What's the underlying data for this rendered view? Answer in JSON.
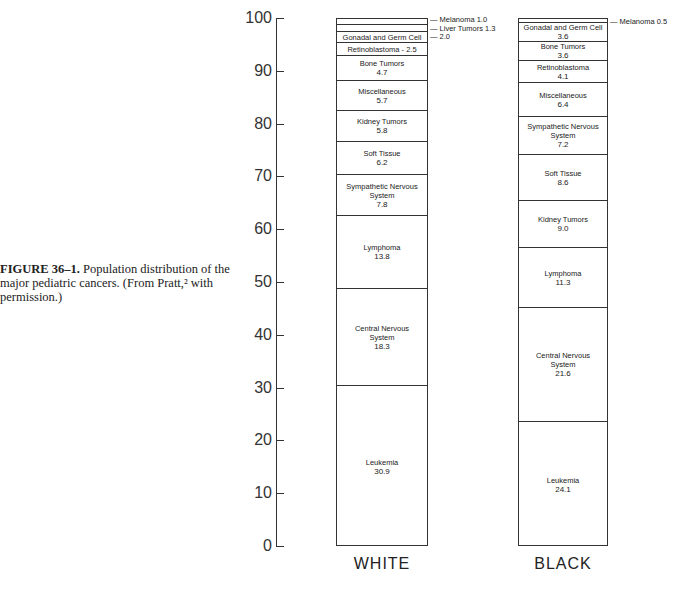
{
  "caption": {
    "label": "FIGURE 36–1.",
    "text": "Population distribution of the major pediatric cancers. (From Pratt,² with permission.)"
  },
  "chart_data": {
    "type": "bar",
    "subtype": "stacked-100-percent",
    "title": "Population distribution of the major pediatric cancers",
    "xlabel": "",
    "ylabel": "",
    "ylim": [
      0,
      100
    ],
    "yticks": [
      "0",
      "10",
      "20",
      "30",
      "40",
      "50",
      "60",
      "70",
      "80",
      "90",
      "100"
    ],
    "categories": [
      "WHITE",
      "BLACK"
    ],
    "grid": false,
    "legend": "none (labels inside segments / callouts)",
    "series": [
      {
        "name": "WHITE",
        "segments_bottom_to_top": [
          {
            "label": "Leukemia",
            "value": 30.9
          },
          {
            "label": "Central Nervous System",
            "value": 18.3
          },
          {
            "label": "Lymphoma",
            "value": 13.8
          },
          {
            "label": "Sympathetic Nervous System",
            "value": 7.8
          },
          {
            "label": "Soft Tissue",
            "value": 6.2
          },
          {
            "label": "Kidney Tumors",
            "value": 5.8
          },
          {
            "label": "Miscellaneous",
            "value": 5.7
          },
          {
            "label": "Bone Tumors",
            "value": 4.7
          },
          {
            "label": "Retinoblastoma",
            "value": 2.5
          },
          {
            "label": "Gonadal and Germ Cell",
            "value": 2.0
          },
          {
            "label": "Liver Tumors",
            "value": 1.3
          },
          {
            "label": "Melanoma",
            "value": 1.0
          }
        ]
      },
      {
        "name": "BLACK",
        "segments_bottom_to_top": [
          {
            "label": "Leukemia",
            "value": 24.1
          },
          {
            "label": "Central Nervous System",
            "value": 21.6
          },
          {
            "label": "Lymphoma",
            "value": 11.3
          },
          {
            "label": "Kidney Tumors",
            "value": 9.0
          },
          {
            "label": "Soft Tissue",
            "value": 8.6
          },
          {
            "label": "Sympathetic Nervous System",
            "value": 7.2
          },
          {
            "label": "Miscellaneous",
            "value": 6.4
          },
          {
            "label": "Retinoblastoma",
            "value": 4.1
          },
          {
            "label": "Bone Tumors",
            "value": 3.6
          },
          {
            "label": "Gonadal and Germ Cell",
            "value": 3.6
          },
          {
            "label": "Melanoma",
            "value": 0.5
          }
        ]
      }
    ]
  },
  "display": {
    "white": {
      "label": "WHITE",
      "melanoma": "— Melanoma  1.0",
      "liver": "— Liver Tumors  1.3",
      "gonadal_value": "— 2.0",
      "gonadal_label": "Gonadal and Germ Cell",
      "retino": "Retinoblastoma - 2.5",
      "bone": [
        "Bone Tumors",
        "4.7"
      ],
      "misc": [
        "Miscellaneous",
        "5.7"
      ],
      "kidney": [
        "Kidney Tumors",
        "5.8"
      ],
      "soft": [
        "Soft Tissue",
        "6.2"
      ],
      "symp": [
        "Sympathetic Nervous",
        "System",
        "7.8"
      ],
      "lymph": [
        "Lymphoma",
        "13.8"
      ],
      "cns": [
        "Central Nervous",
        "System",
        "18.3"
      ],
      "leuk": [
        "Leukemia",
        "30.9"
      ]
    },
    "black": {
      "label": "BLACK",
      "melanoma": "— Melanoma  0.5",
      "gonadal": [
        "Gonadal and Germ Cell",
        "3.6"
      ],
      "bone": [
        "Bone Tumors",
        "3.6"
      ],
      "retino": [
        "Retinoblastoma",
        "4.1"
      ],
      "misc": [
        "Miscellaneous",
        "6.4"
      ],
      "symp": [
        "Sympathetic Nervous",
        "System",
        "7.2"
      ],
      "soft": [
        "Soft Tissue",
        "8.6"
      ],
      "kidney": [
        "Kidney Tumors",
        "9.0"
      ],
      "lymph": [
        "Lymphoma",
        "11.3"
      ],
      "cns": [
        "Central Nervous",
        "System",
        "21.6"
      ],
      "leuk": [
        "Leukemia",
        "24.1"
      ]
    }
  }
}
